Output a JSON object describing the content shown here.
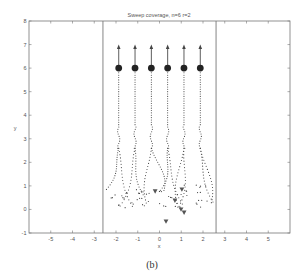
{
  "chart_data": {
    "type": "scatter",
    "title": "Sweep coverage, n=6 r=2",
    "xlabel": "x",
    "ylabel": "y",
    "xlim": [
      -6,
      6
    ],
    "ylim": [
      -1,
      8
    ],
    "xticks": [
      -5,
      -4,
      -3,
      -2,
      -1,
      0,
      1,
      2,
      3,
      4,
      5
    ],
    "yticks": [
      -1,
      0,
      1,
      2,
      3,
      4,
      5,
      6,
      7,
      8
    ],
    "grid": false,
    "legend": null,
    "boundary_lines_x": [
      -2.6,
      2.6
    ],
    "agents": {
      "marker": "filled-circle",
      "x": [
        -1.875,
        -1.125,
        -0.375,
        0.375,
        1.125,
        1.875
      ],
      "y": [
        6,
        6,
        6,
        6,
        6,
        6
      ]
    },
    "arrows": {
      "direction": "up",
      "x": [
        -1.875,
        -1.125,
        -0.375,
        0.375,
        1.125,
        1.875
      ],
      "y_start": [
        6,
        6,
        6,
        6,
        6,
        6
      ],
      "y_end": [
        7,
        7,
        7,
        7,
        7,
        7
      ]
    },
    "targets": {
      "marker": "down-triangle",
      "x": [
        -0.2,
        1.03,
        0.71,
        0.99,
        1.13,
        0.3
      ],
      "y": [
        0.77,
        0.85,
        0.38,
        0.0,
        -0.13,
        -0.51
      ]
    },
    "trajectories": {
      "style": "dotted",
      "description": "Dotted paths from scattered start positions near y=0-2 converging into vertical lines under each agent up to y=6"
    }
  },
  "caption": "(b)",
  "colors": {
    "axis": "#777777",
    "text": "#555555",
    "marker": "#222222",
    "dots": "#444444",
    "triangle": "#555555"
  }
}
